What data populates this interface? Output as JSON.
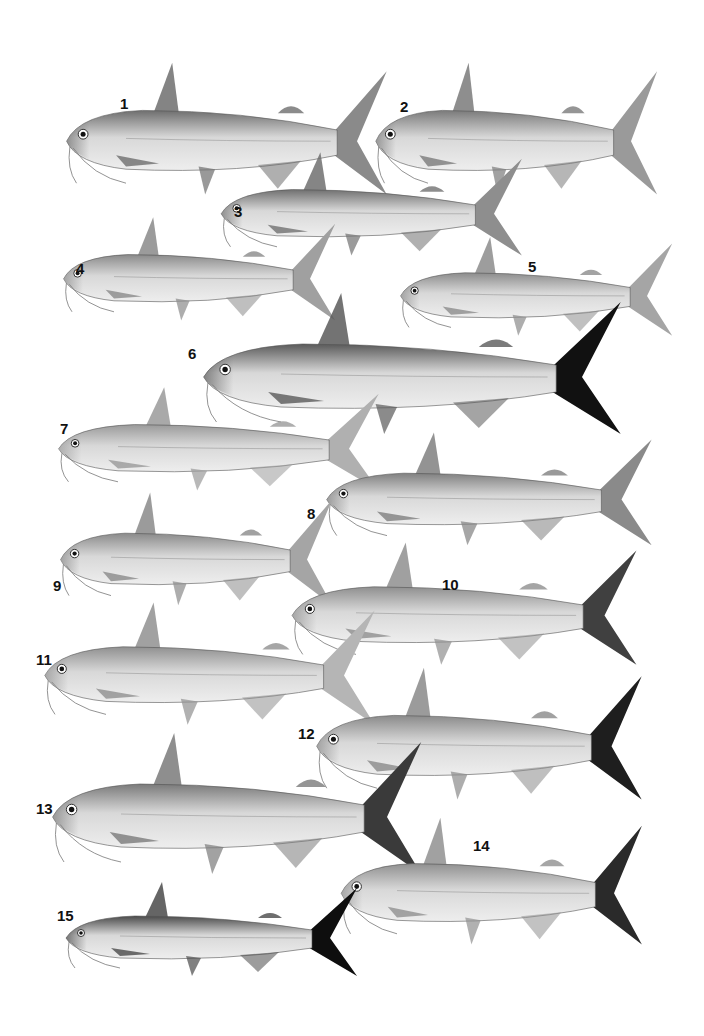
{
  "plate": {
    "subject": "Catfish species illustration plate",
    "background": "#ffffff",
    "specimens": [
      {
        "label": "1",
        "x": 60,
        "y": 60,
        "w": 330,
        "h": 140,
        "tone": "#6e6e6e",
        "tail": "#8a8a8a",
        "lx": 120,
        "ly": 95
      },
      {
        "label": "2",
        "x": 370,
        "y": 60,
        "w": 290,
        "h": 140,
        "tone": "#7a7a7a",
        "tail": "#9a9a9a",
        "lx": 400,
        "ly": 98
      },
      {
        "label": "3",
        "x": 215,
        "y": 150,
        "w": 310,
        "h": 110,
        "tone": "#707070",
        "tail": "#8e8e8e",
        "lx": 234,
        "ly": 203
      },
      {
        "label": "4",
        "x": 58,
        "y": 215,
        "w": 280,
        "h": 110,
        "tone": "#8a8a8a",
        "tail": "#a0a0a0",
        "lx": 76,
        "ly": 260
      },
      {
        "label": "5",
        "x": 395,
        "y": 235,
        "w": 280,
        "h": 105,
        "tone": "#8c8c8c",
        "tail": "#a5a5a5",
        "lx": 528,
        "ly": 258
      },
      {
        "label": "6",
        "x": 195,
        "y": 290,
        "w": 430,
        "h": 150,
        "tone": "#5a5a5a",
        "tail": "#111111",
        "lx": 188,
        "ly": 345
      },
      {
        "label": "7",
        "x": 52,
        "y": 385,
        "w": 330,
        "h": 110,
        "tone": "#9a9a9a",
        "tail": "#b0b0b0",
        "lx": 60,
        "ly": 420
      },
      {
        "label": "8",
        "x": 320,
        "y": 430,
        "w": 335,
        "h": 120,
        "tone": "#808080",
        "tail": "#8a8a8a",
        "lx": 307,
        "ly": 505
      },
      {
        "label": "9",
        "x": 55,
        "y": 490,
        "w": 280,
        "h": 120,
        "tone": "#8a8a8a",
        "tail": "#a5a5a5",
        "lx": 53,
        "ly": 577
      },
      {
        "label": "10",
        "x": 285,
        "y": 540,
        "w": 355,
        "h": 130,
        "tone": "#8f8f8f",
        "tail": "#404040",
        "lx": 442,
        "ly": 576
      },
      {
        "label": "11",
        "x": 38,
        "y": 600,
        "w": 340,
        "h": 130,
        "tone": "#909090",
        "tail": "#b5b5b5",
        "lx": 36,
        "ly": 651
      },
      {
        "label": "12",
        "x": 310,
        "y": 665,
        "w": 335,
        "h": 140,
        "tone": "#8a8a8a",
        "tail": "#1e1e1e",
        "lx": 298,
        "ly": 725
      },
      {
        "label": "13",
        "x": 45,
        "y": 730,
        "w": 380,
        "h": 150,
        "tone": "#7a7a7a",
        "tail": "#3a3a3a",
        "lx": 36,
        "ly": 800
      },
      {
        "label": "14",
        "x": 335,
        "y": 815,
        "w": 310,
        "h": 135,
        "tone": "#909090",
        "tail": "#2a2a2a",
        "lx": 473,
        "ly": 837
      },
      {
        "label": "15",
        "x": 60,
        "y": 880,
        "w": 300,
        "h": 100,
        "tone": "#4a4a4a",
        "tail": "#0e0e0e",
        "lx": 57,
        "ly": 907
      }
    ]
  }
}
